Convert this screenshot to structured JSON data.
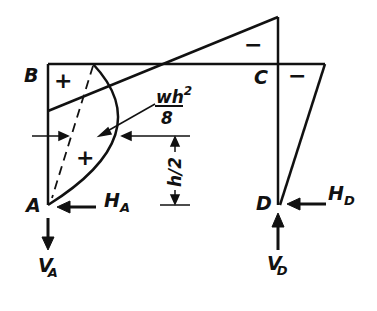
{
  "diagram": {
    "type": "frame-bending-moment-diagram",
    "nodes": {
      "A": {
        "label": "A"
      },
      "B": {
        "label": "B"
      },
      "C": {
        "label": "C"
      },
      "D": {
        "label": "D"
      }
    },
    "reactions": {
      "HA": {
        "main": "H",
        "sub": "A"
      },
      "VA": {
        "main": "V",
        "sub": "A"
      },
      "HD": {
        "main": "H",
        "sub": "D"
      },
      "VD": {
        "main": "V",
        "sub": "D"
      }
    },
    "annotations": {
      "parabola_peak_num": "wh",
      "parabola_peak_exp": "2",
      "parabola_peak_den": "8",
      "dimension_num": "h",
      "dimension_den": "/2"
    },
    "signs": {
      "B_region": "+",
      "column_AB_region": "+",
      "beam_top": "−",
      "C_right": "−"
    },
    "colors": {
      "stroke": "#111111",
      "background": "#ffffff"
    }
  }
}
